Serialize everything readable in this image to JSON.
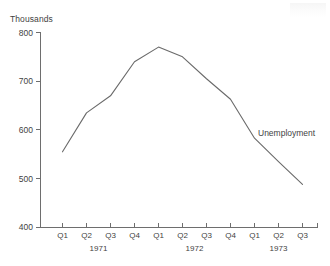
{
  "chart_data": {
    "type": "line",
    "title": "",
    "subtitle": "",
    "ylabel": "Thousands",
    "xlabel": "",
    "ylim": [
      400,
      800
    ],
    "yticks": [
      400,
      500,
      600,
      700,
      800
    ],
    "ytick_labels": [
      "400",
      "500",
      "600",
      "700",
      "800"
    ],
    "grid": false,
    "legend_position": "inline-annotation",
    "categories": [
      "Q1",
      "Q2",
      "Q3",
      "Q4",
      "Q1",
      "Q2",
      "Q3",
      "Q4",
      "Q1",
      "Q2",
      "Q3"
    ],
    "group_labels": [
      {
        "label": "1971",
        "start_index": 0,
        "end_index": 3
      },
      {
        "label": "1972",
        "start_index": 4,
        "end_index": 7
      },
      {
        "label": "1973",
        "start_index": 8,
        "end_index": 10
      }
    ],
    "series": [
      {
        "name": "Unemployment",
        "annotation": "Unemployment",
        "color": "#6a6a6a",
        "values": [
          555,
          635,
          670,
          740,
          770,
          750,
          705,
          663,
          583,
          535,
          488
        ]
      }
    ]
  },
  "annotations": {
    "series_label": "Unemployment"
  },
  "axis": {
    "y_title": "Thousands"
  },
  "colors": {
    "line": "#6a6a6a",
    "axis": "#6e6e6e",
    "text": "#3f3f3f",
    "background": "#ffffff"
  }
}
